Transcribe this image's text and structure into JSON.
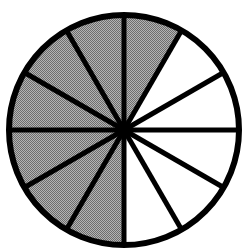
{
  "figure": {
    "kind": "fraction-circle"
  },
  "colors": {
    "shaded_fill": "#9d9d9d",
    "unshaded_fill": "#ffffff",
    "stroke": "#000000",
    "background": "#ffffff"
  },
  "geometry": {
    "center_x": 124,
    "center_y": 130,
    "radius": 115,
    "outline_width": 6,
    "divider_width": 5,
    "sector_count": 12,
    "sector_angle_degrees": 30,
    "start_angle_degrees": -90
  },
  "chart_data": {
    "type": "pie",
    "xlabel": "",
    "ylabel": "",
    "legend_position": "none",
    "grid": false,
    "total_slices": 12,
    "shaded_slices": 7,
    "unshaded_slices": 5,
    "fraction": "7/12",
    "percent_shaded": 58.3,
    "categories": [
      "slice-1",
      "slice-2",
      "slice-3",
      "slice-4",
      "slice-5",
      "slice-6",
      "slice-7",
      "slice-8",
      "slice-9",
      "slice-10",
      "slice-11",
      "slice-12"
    ],
    "values": [
      8.333,
      8.333,
      8.333,
      8.333,
      8.333,
      8.333,
      8.333,
      8.333,
      8.333,
      8.333,
      8.333,
      8.333
    ],
    "slices": [
      {
        "index": 1,
        "start_deg": -90,
        "end_deg": -60,
        "shaded": true,
        "fill": "#9d9d9d",
        "label": "slice-1"
      },
      {
        "index": 2,
        "start_deg": -60,
        "end_deg": -30,
        "shaded": false,
        "fill": "#ffffff",
        "label": "slice-2"
      },
      {
        "index": 3,
        "start_deg": -30,
        "end_deg": 0,
        "shaded": false,
        "fill": "#ffffff",
        "label": "slice-3"
      },
      {
        "index": 4,
        "start_deg": 0,
        "end_deg": 30,
        "shaded": false,
        "fill": "#ffffff",
        "label": "slice-4"
      },
      {
        "index": 5,
        "start_deg": 30,
        "end_deg": 60,
        "shaded": false,
        "fill": "#ffffff",
        "label": "slice-5"
      },
      {
        "index": 6,
        "start_deg": 60,
        "end_deg": 90,
        "shaded": false,
        "fill": "#ffffff",
        "label": "slice-6"
      },
      {
        "index": 7,
        "start_deg": 90,
        "end_deg": 120,
        "shaded": true,
        "fill": "#9d9d9d",
        "label": "slice-7"
      },
      {
        "index": 8,
        "start_deg": 120,
        "end_deg": 150,
        "shaded": true,
        "fill": "#9d9d9d",
        "label": "slice-8"
      },
      {
        "index": 9,
        "start_deg": 150,
        "end_deg": 180,
        "shaded": true,
        "fill": "#9d9d9d",
        "label": "slice-9"
      },
      {
        "index": 10,
        "start_deg": 180,
        "end_deg": 210,
        "shaded": true,
        "fill": "#9d9d9d",
        "label": "slice-10"
      },
      {
        "index": 11,
        "start_deg": 210,
        "end_deg": 240,
        "shaded": true,
        "fill": "#9d9d9d",
        "label": "slice-11"
      },
      {
        "index": 12,
        "start_deg": 240,
        "end_deg": 270,
        "shaded": true,
        "fill": "#9d9d9d",
        "label": "slice-12"
      }
    ]
  }
}
